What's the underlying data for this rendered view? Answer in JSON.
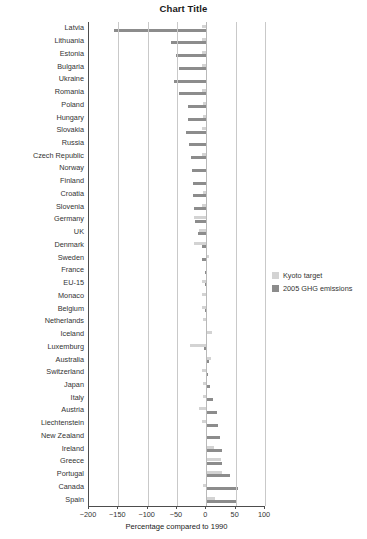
{
  "chart_data": {
    "type": "bar",
    "orientation": "horizontal",
    "title": "Chart Title",
    "xlabel": "Percentage compared to 1990",
    "ylabel": "",
    "xlim": [
      -200,
      100
    ],
    "xticks": [
      -200,
      -150,
      -100,
      -50,
      0,
      50,
      100
    ],
    "xtick_labels": [
      "−200",
      "−150",
      "−100",
      "−50",
      "0",
      "50",
      "100"
    ],
    "grid": true,
    "grid_axis": "x",
    "legend_position": "right",
    "categories": [
      "Latvia",
      "Lithuania",
      "Estonia",
      "Bulgaria",
      "Ukraine",
      "Romania",
      "Poland",
      "Hungary",
      "Slovakia",
      "Russia",
      "Czech Republic",
      "Norway",
      "Finland",
      "Croatia",
      "Slovenia",
      "Germany",
      "UK",
      "Denmark",
      "Sweden",
      "France",
      "EU-15",
      "Monaco",
      "Belgium",
      "Netherlands",
      "Iceland",
      "Luxemburg",
      "Australia",
      "Switzerland",
      "Japan",
      "Italy",
      "Austria",
      "Liechtenstein",
      "New Zealand",
      "Ireland",
      "Greece",
      "Portugal",
      "Canada",
      "Spain"
    ],
    "series": [
      {
        "name": "Kyoto target",
        "color": "#d3d3d3",
        "values": [
          -8,
          -8,
          -8,
          -8,
          0,
          -8,
          -6,
          -6,
          -8,
          0,
          -8,
          1,
          0,
          -5,
          -8,
          -21,
          -12.5,
          -21,
          4,
          0,
          -8,
          -8,
          -7.5,
          -6,
          10,
          -28,
          8,
          -8,
          -6,
          -6.5,
          -13,
          -8,
          0,
          13,
          25,
          27,
          -6,
          15
        ]
      },
      {
        "name": "2005 GHG emissions",
        "color": "#8c8c8c",
        "values": [
          -158,
          -60,
          -52,
          -47,
          -55,
          -46,
          -32,
          -32,
          -34,
          -29,
          -26,
          -25,
          -23,
          -23,
          -21,
          -19,
          -15,
          -7,
          -7,
          -2,
          -2,
          -1,
          -2,
          -1,
          1,
          -4,
          4,
          2,
          7,
          12,
          18,
          20,
          23,
          26,
          26,
          41,
          54,
          53
        ]
      }
    ]
  },
  "legend": {
    "items": [
      {
        "label": "Kyoto target",
        "color": "#d3d3d3"
      },
      {
        "label": "2005 GHG emissions",
        "color": "#8c8c8c"
      }
    ]
  }
}
